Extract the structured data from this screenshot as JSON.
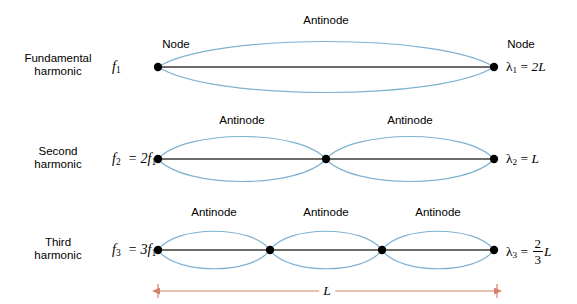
{
  "figure": {
    "title": "",
    "background_color": "#ffffff",
    "wave_color": "#7fb2cf",
    "string_color": "#3b3b3b",
    "node_color": "#000000",
    "dimension_color": "#d4836a",
    "text_color": "#000000"
  },
  "rows": [
    {
      "name_line1": "Fundamental",
      "name_line2": "harmonic",
      "frequency": "f",
      "frequency_sub": "1",
      "frequency_rest": "",
      "wavelength_symbol": "λ",
      "wavelength_sub": "1",
      "wavelength_eq": "=",
      "wavelength_value": "2L",
      "wavelength_is_fraction": false,
      "node_labels": [
        "Node",
        "Node"
      ],
      "antinode_labels": [
        "Antinode"
      ],
      "node_count": 2,
      "antinode_count": 1
    },
    {
      "name_line1": "Second",
      "name_line2": "harmonic",
      "frequency": "f",
      "frequency_sub": "2",
      "frequency_rest": "= 2f",
      "frequency_rest_sub": "1",
      "wavelength_symbol": "λ",
      "wavelength_sub": "2",
      "wavelength_eq": "=",
      "wavelength_value": "L",
      "wavelength_is_fraction": false,
      "node_labels": [],
      "antinode_labels": [
        "Antinode",
        "Antinode"
      ],
      "node_count": 3,
      "antinode_count": 2
    },
    {
      "name_line1": "Third",
      "name_line2": "harmonic",
      "frequency": "f",
      "frequency_sub": "3",
      "frequency_rest": "= 3f",
      "frequency_rest_sub": "1",
      "wavelength_symbol": "λ",
      "wavelength_sub": "3",
      "wavelength_eq": "=",
      "wavelength_numerator": "2",
      "wavelength_denominator": "3",
      "wavelength_value": "L",
      "wavelength_is_fraction": true,
      "node_labels": [],
      "antinode_labels": [
        "Antinode",
        "Antinode",
        "Antinode"
      ],
      "node_count": 4,
      "antinode_count": 3
    }
  ],
  "dimension": {
    "label": "L",
    "description": "string length"
  },
  "geometry": {
    "string_left_x": 158,
    "string_right_x": 494,
    "row_axis_y": [
      67,
      159,
      250
    ],
    "amplitudes": [
      34,
      30,
      25
    ],
    "dimension_y": 291
  }
}
